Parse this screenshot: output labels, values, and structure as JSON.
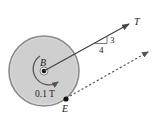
{
  "diagram": {
    "type": "free-body diagram of disk",
    "labels": {
      "center": "B",
      "tension": "T",
      "point": "E",
      "moment": "0.1 T",
      "slope_rise": "3",
      "slope_run": "4"
    },
    "colors": {
      "disk_fill": "#cfcfcf",
      "disk_rim": "#8a8a8a",
      "line": "#444444",
      "text": "#222222"
    }
  }
}
